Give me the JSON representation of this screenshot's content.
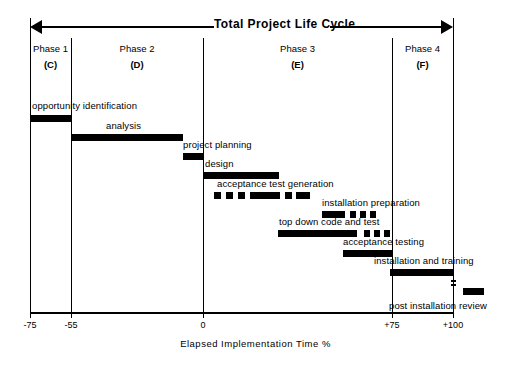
{
  "header": {
    "title": "Total  Project  Life  Cycle",
    "arrow_left_icon": "arrow-left-icon",
    "arrow_right_icon": "arrow-right-icon"
  },
  "phases": [
    {
      "name": "Phase 1",
      "code": "(C)",
      "left": 30,
      "width": 41
    },
    {
      "name": "Phase 2",
      "code": "(D)",
      "left": 71,
      "width": 132
    },
    {
      "name": "Phase 3",
      "code": "(E)",
      "left": 203,
      "width": 189
    },
    {
      "name": "Phase 4",
      "code": "(F)",
      "left": 392,
      "width": 61
    }
  ],
  "dividers": [
    {
      "name": "axis-start-line",
      "x": 30,
      "top": 18,
      "height": 294
    },
    {
      "name": "phase1-phase2-line",
      "x": 71,
      "top": 38,
      "height": 274
    },
    {
      "name": "phase2-phase3-line",
      "x": 203,
      "top": 38,
      "height": 274
    },
    {
      "name": "phase3-phase4-line",
      "x": 392,
      "top": 38,
      "height": 274
    },
    {
      "name": "axis-end-line",
      "x": 453,
      "top": 18,
      "height": 294
    }
  ],
  "axis": {
    "label": "Elapsed  Implementation  Time  %",
    "ticks": [
      {
        "value": "-75",
        "x": 30
      },
      {
        "value": "-55",
        "x": 71
      },
      {
        "value": "0",
        "x": 203
      },
      {
        "value": "+75",
        "x": 392
      },
      {
        "value": "+100",
        "x": 453
      }
    ]
  },
  "chart_data": {
    "type": "bar",
    "title": "Total  Project  Life  Cycle",
    "xlabel": "Elapsed  Implementation  Time  %",
    "ylabel": "",
    "xlim": [
      -75,
      100
    ],
    "grid": false,
    "legend": "none",
    "categories": [
      "opportunity identification",
      "analysis",
      "project planning",
      "design",
      "acceptance test generation",
      "installation preparation",
      "top down code and test",
      "acceptance testing",
      "installation and training",
      "post installation review"
    ],
    "tasks": [
      {
        "label": "opportunity identification",
        "start_pct": -75,
        "end_pct": -55,
        "bar_left": 30,
        "bar_width": 41,
        "bar_top": 115,
        "label_left": 32,
        "label_top": 100,
        "style": "solid"
      },
      {
        "label": "analysis",
        "start_pct": -55,
        "end_pct": 0,
        "bar_left": 71,
        "bar_width": 112,
        "bar_top": 134,
        "label_left": 106,
        "label_top": 120,
        "style": "solid"
      },
      {
        "label": "project planning",
        "start_pct": -8,
        "end_pct": 0,
        "bar_left": 183,
        "bar_width": 20,
        "bar_top": 153,
        "label_left": 183,
        "label_top": 139,
        "style": "solid"
      },
      {
        "label": "design",
        "start_pct": 0,
        "end_pct": 33,
        "bar_left": 203,
        "bar_width": 76,
        "bar_top": 172,
        "label_left": 205,
        "label_top": 158,
        "style": "solid"
      },
      {
        "label": "acceptance test generation",
        "start_pct": 5,
        "end_pct": 46,
        "bar_left": 214,
        "bar_width": 96,
        "bar_top": 192,
        "label_left": 217,
        "label_top": 178,
        "style": "dashed",
        "segments": [
          {
            "left": 0,
            "width": 7
          },
          {
            "left": 12,
            "width": 7
          },
          {
            "left": 24,
            "width": 7
          },
          {
            "left": 36,
            "width": 30
          },
          {
            "left": 71,
            "width": 7
          },
          {
            "left": 82,
            "width": 7
          },
          {
            "left": 89,
            "width": 7
          }
        ]
      },
      {
        "label": "installation preparation",
        "start_pct": 52,
        "end_pct": 72,
        "bar_left": 322,
        "bar_width": 48,
        "bar_top": 211,
        "label_left": 322,
        "label_top": 197,
        "style": "dashed",
        "segments": [
          {
            "left": 0,
            "width": 23
          },
          {
            "left": 28,
            "width": 6
          },
          {
            "left": 38,
            "width": 6
          },
          {
            "left": 48,
            "width": 6
          }
        ]
      },
      {
        "label": "top down code and test",
        "start_pct": 33,
        "end_pct": 79,
        "bar_left": 278,
        "bar_width": 112,
        "bar_top": 230,
        "label_left": 279,
        "label_top": 216,
        "style": "dashed",
        "segments": [
          {
            "left": 0,
            "width": 79
          },
          {
            "left": 86,
            "width": 6
          },
          {
            "left": 96,
            "width": 6
          },
          {
            "left": 106,
            "width": 6
          }
        ]
      },
      {
        "label": "acceptance testing",
        "start_pct": 60,
        "end_pct": 81,
        "bar_left": 343,
        "bar_width": 49,
        "bar_top": 250,
        "label_left": 343,
        "label_top": 236,
        "style": "solid"
      },
      {
        "label": "installation and training",
        "start_pct": 79,
        "end_pct": 100,
        "bar_left": 390,
        "bar_width": 63,
        "bar_top": 269,
        "label_left": 374,
        "label_top": 255,
        "style": "solid"
      },
      {
        "label": "post installation review",
        "start_pct": 104,
        "end_pct": 112,
        "bar_left": 463,
        "bar_width": 21,
        "bar_top": 288,
        "label_left": 389,
        "label_top": 300,
        "style": "solid"
      }
    ],
    "markers": [
      {
        "name": "post-installation-marker",
        "x": 451,
        "y": 280
      },
      {
        "name": "post-installation-marker",
        "x": 451,
        "y": 284
      }
    ]
  }
}
